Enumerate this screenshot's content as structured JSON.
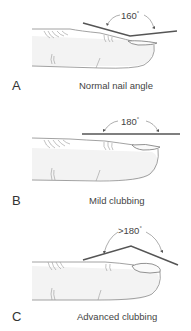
{
  "figure": {
    "panels": [
      {
        "letter": "A",
        "caption": "Normal nail angle",
        "angle": "160",
        "degree_symbol": "°"
      },
      {
        "letter": "B",
        "caption": "Mild clubbing",
        "angle": "180",
        "degree_symbol": "°"
      },
      {
        "letter": "C",
        "caption": "Advanced clubbing",
        "angle": ">180",
        "degree_symbol": "°"
      }
    ]
  },
  "colors": {
    "line": "#555555",
    "finger_outline": "#8a8a8a",
    "finger_shade": "#f1f1f1",
    "text": "#444444"
  }
}
